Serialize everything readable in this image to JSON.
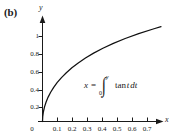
{
  "figure": {
    "panel_label": "(b)",
    "background_color": "#ffffff",
    "ink_color": "#1a1a1a"
  },
  "equation": {
    "lhs": "x",
    "equals": "=",
    "integral_symbol": "∫",
    "lower_limit": "0",
    "upper_limit": "y",
    "integrand_function": "tan",
    "integrand_variable": "t",
    "differential_d": "d",
    "differential_variable": "t",
    "plain_text": "x = ∫₀ʸ tan t dt"
  },
  "chart_data": {
    "type": "line",
    "title": "",
    "subtitle": "",
    "xlabel": "x",
    "ylabel": "y",
    "xlim": [
      0,
      0.79
    ],
    "ylim": [
      0,
      1.18
    ],
    "grid": false,
    "legend": null,
    "annotations": [
      {
        "text": "x = ∫₀ʸ tan t dt",
        "x": 0.34,
        "y": 0.45
      }
    ],
    "x_ticks": [
      0,
      0.1,
      0.2,
      0.3,
      0.4,
      0.5,
      0.6,
      0.7
    ],
    "x_tick_labels": [
      "0",
      "0.1",
      "0.2",
      "0.3",
      "0.4",
      "0.5",
      "0.6",
      "0.7"
    ],
    "y_ticks": [
      0.2,
      0.4,
      0.6,
      0.8,
      1
    ],
    "y_tick_labels": [
      "0.2",
      "0.4",
      "0.6",
      "0.8",
      "1"
    ],
    "series": [
      {
        "name": "y as function of x where x = integral from 0 to y of tan t dt",
        "color": "#111111",
        "x": [
          0,
          0.0015,
          0.006,
          0.0135,
          0.024,
          0.0375,
          0.0543,
          0.0746,
          0.0986,
          0.1266,
          0.1589,
          0.196,
          0.2383,
          0.2864,
          0.3409,
          0.4026,
          0.4724,
          0.5515,
          0.6412,
          0.7433,
          0.79
        ],
        "y": [
          0,
          0.055,
          0.11,
          0.165,
          0.22,
          0.275,
          0.33,
          0.385,
          0.44,
          0.495,
          0.55,
          0.605,
          0.66,
          0.715,
          0.77,
          0.825,
          0.88,
          0.935,
          0.99,
          1.045,
          1.068
        ]
      }
    ]
  }
}
